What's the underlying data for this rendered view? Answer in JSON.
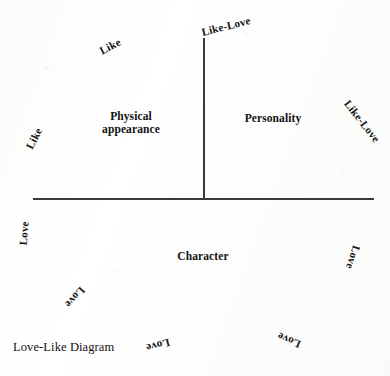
{
  "figure": {
    "caption": "Love-Like Diagram",
    "background_color": "#fdfdfc",
    "ink_color": "#121212",
    "axis_color": "#3a3a3a"
  },
  "axes": {
    "horizontal": {
      "name": "horizontal-axis"
    },
    "vertical": {
      "name": "vertical-axis"
    }
  },
  "quadrants": {
    "top_left": "Physical\nappearance",
    "top_left_line1": "Physical",
    "top_left_line2": "appearance",
    "top_right": "Personality",
    "bottom": "Character"
  },
  "radial_labels": {
    "top_center": "Like-Love",
    "upper_left": "Like",
    "left": "Like",
    "right": "Like-Love",
    "lower_left_vertical": "Love",
    "lower_right": "Love",
    "lower_left_inner": "Love",
    "bottom_center": "Love",
    "bottom_right": "Love"
  },
  "chart_data": {
    "type": "diagram",
    "title": "Love-Like Diagram",
    "regions": [
      {
        "name": "Physical appearance",
        "position": "upper-left quadrant"
      },
      {
        "name": "Personality",
        "position": "upper-right quadrant"
      },
      {
        "name": "Character",
        "position": "lower half"
      }
    ],
    "axis_tip_labels": [
      {
        "text": "Like",
        "angle_deg": -63,
        "position": "far-left"
      },
      {
        "text": "Like",
        "angle_deg": -27,
        "position": "upper-left"
      },
      {
        "text": "Like-Love",
        "angle_deg": -14,
        "position": "top-center"
      },
      {
        "text": "Like-Love",
        "angle_deg": 52,
        "position": "far-right"
      },
      {
        "text": "Love",
        "angle_deg": -86,
        "position": "lower-left-vertical"
      },
      {
        "text": "Love",
        "angle_deg": 132,
        "position": "lower-left-inner"
      },
      {
        "text": "Love",
        "angle_deg": 166,
        "position": "bottom-center"
      },
      {
        "text": "Love",
        "angle_deg": -158,
        "position": "bottom-right"
      },
      {
        "text": "Love",
        "angle_deg": 108,
        "position": "lower-right"
      }
    ],
    "grid": false,
    "legend": "none"
  }
}
